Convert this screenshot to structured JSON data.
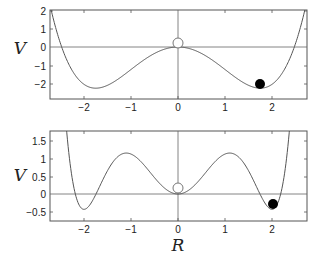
{
  "chart_data": [
    {
      "type": "line",
      "title": "",
      "xlabel": "",
      "ylabel": "V",
      "xlim": [
        -2.72,
        2.74
      ],
      "ylim": [
        -2.85,
        2.0
      ],
      "xticks": [
        -2,
        -1,
        0,
        1,
        2
      ],
      "xtick_labels": [
        "-2",
        "-1",
        "0",
        "1",
        "2"
      ],
      "yticks": [
        2,
        1,
        0,
        -1,
        -2
      ],
      "ytick_labels": [
        "2",
        "1",
        "0",
        "−1",
        "−2"
      ],
      "grid": false,
      "reference_lines": {
        "horizontal_at": 0,
        "vertical_at": 0
      },
      "series": [
        {
          "name": "double-well potential",
          "formula": "V = 0.24*(R^4 - 2*1.75^2*R^2)",
          "x": [
            -2.72,
            -2.6,
            -2.47,
            -2.2,
            -2.0,
            -1.75,
            -1.5,
            -1.0,
            -0.5,
            0,
            0.5,
            1.0,
            1.5,
            1.75,
            2.0,
            2.2,
            2.47,
            2.6,
            2.74
          ],
          "values": [
            1.74,
            1.07,
            0.0,
            -1.51,
            -1.85,
            -2.25,
            -2.0,
            -1.23,
            -0.35,
            0.0,
            -0.35,
            -1.23,
            -2.0,
            -2.25,
            -1.85,
            -1.51,
            0.0,
            1.07,
            2.0
          ]
        }
      ],
      "markers": [
        {
          "name": "open-circle",
          "x": 0.0,
          "y": 0.25,
          "filled": false
        },
        {
          "name": "filled-circle",
          "x": 1.75,
          "y": -2.0,
          "filled": true
        }
      ]
    },
    {
      "type": "line",
      "title": "",
      "xlabel": "R",
      "ylabel": "V",
      "xlim": [
        -2.72,
        2.74
      ],
      "ylim": [
        -0.76,
        1.78
      ],
      "xticks": [
        -2,
        -1,
        0,
        1,
        2
      ],
      "xtick_labels": [
        "−2",
        "−1",
        "0",
        "1",
        "2"
      ],
      "yticks": [
        1.5,
        1,
        0.5,
        0,
        -0.5
      ],
      "ytick_labels": [
        "1.5",
        "1",
        "0.5",
        "0",
        "−0.5"
      ],
      "grid": false,
      "reference_lines": {
        "horizontal_at": 0,
        "vertical_at": 0
      },
      "series": [
        {
          "name": "triple-well potential",
          "formula": "V = c*(14.52 R^2 - 7.815 R^4 + R^6), c=0.146",
          "x": [
            -2.4,
            -2.2,
            -2.0,
            -1.8,
            -1.5,
            -1.1,
            -0.8,
            -0.5,
            0,
            0.5,
            0.8,
            1.1,
            1.5,
            1.8,
            2.0,
            2.2,
            2.4
          ],
          "values": [
            1.78,
            0.03,
            -0.43,
            -0.24,
            0.55,
            1.15,
            0.93,
            0.47,
            0.0,
            0.47,
            0.93,
            1.15,
            0.55,
            -0.24,
            -0.43,
            0.03,
            1.78
          ]
        }
      ],
      "markers": [
        {
          "name": "open-circle",
          "x": 0.0,
          "y": 0.15,
          "filled": false
        },
        {
          "name": "filled-circle",
          "x": 2.0,
          "y": -0.28,
          "filled": true
        }
      ]
    }
  ],
  "labels": {
    "top_ylabel": "V",
    "bottom_ylabel": "V",
    "bottom_xlabel": "R"
  },
  "ticks": {
    "top_y": [
      "2",
      "1",
      "0",
      "−1",
      "−2"
    ],
    "bottom_y": [
      "1.5",
      "1",
      "0.5",
      "0",
      "−0.5"
    ],
    "top_x": [
      "−2",
      "−1",
      "0",
      "1",
      "2"
    ],
    "bottom_x": [
      "−2",
      "−1",
      "0",
      "1",
      "2"
    ]
  },
  "colors": {
    "curve": "#555555",
    "frame": "#555555",
    "marker": "#000000"
  }
}
